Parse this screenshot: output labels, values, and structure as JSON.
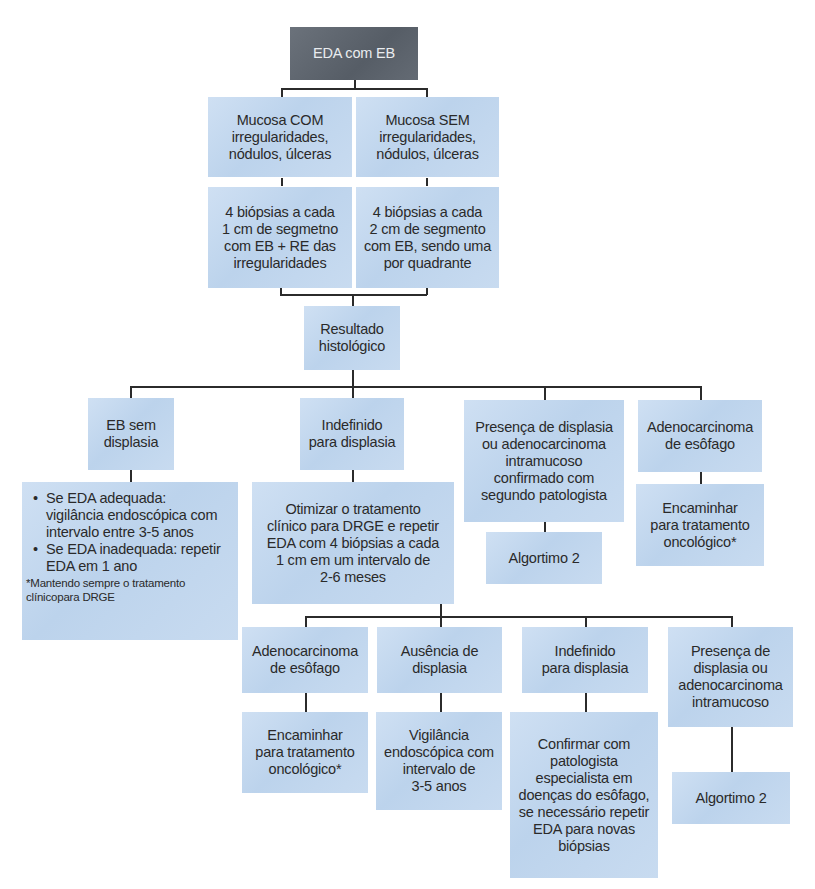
{
  "diagram": {
    "type": "flowchart",
    "root": {
      "label": "EDA com EB",
      "color": "#5f6670"
    },
    "box_color": "#c6daf0",
    "line_color": "#2b2b2b",
    "level1": [
      {
        "label": "Mucosa COM\nirregularidades,\nnódulos, úlceras"
      },
      {
        "label": "Mucosa SEM\nirregularidades,\nnódulos, úlceras"
      }
    ],
    "level1b": [
      {
        "label": "4 biópsias a cada\n1 cm de segmetno\ncom EB + RE das\nirregularidades"
      },
      {
        "label": "4 biópsias a cada\n2 cm de segmento\ncom EB, sendo uma\npor quadrante"
      }
    ],
    "result": {
      "label": "Resultado\nhistológico"
    },
    "level3": [
      {
        "label": "EB sem\ndisplasia"
      },
      {
        "label": "Indefinido\npara displasia"
      },
      {
        "label": "Presença de displasia\nou adenocarcinoma\nintramucoso\nconfirmado com\nsegundo patologista"
      },
      {
        "label": "Adenocarcinoma\nde esôfago"
      }
    ],
    "level4": {
      "no_dysplasia": {
        "bullets": [
          "Se EDA adequada:\nvigilância endoscópica com\nintervalo entre 3-5 anos",
          "Se EDA inadequada: repetir\nEDA em 1 ano"
        ],
        "note": "*Mantendo sempre o tratamento\nclínicopara DRGE"
      },
      "indefinite": {
        "label": "Otimizar o tratamento\nclínico para DRGE e repetir\nEDA com 4 biópsias a cada\n1 cm em um intervalo de\n2-6 meses"
      },
      "dysplasia": {
        "label": "Algortimo 2"
      },
      "adenocarcinoma": {
        "label": "Encaminhar\npara tratamento\noncológico*"
      }
    },
    "level5": [
      {
        "label": "Adenocarcinoma\nde esôfago"
      },
      {
        "label": "Ausência de\ndisplasia"
      },
      {
        "label": "Indefinido\npara displasia"
      },
      {
        "label": "Presença de\ndisplasia ou\nadenocarcinoma\nintramucoso"
      }
    ],
    "level6": [
      {
        "label": "Encaminhar\npara tratamento\noncológico*"
      },
      {
        "label": "Vigilância\nendoscópica com\nintervalo de\n3-5 anos"
      },
      {
        "label": "Confirmar com\npatologista\nespecialista em\ndoenças do esôfago,\nse necessário repetir\nEDA para novas\nbiópsias"
      },
      {
        "label": "Algortimo 2"
      }
    ]
  }
}
